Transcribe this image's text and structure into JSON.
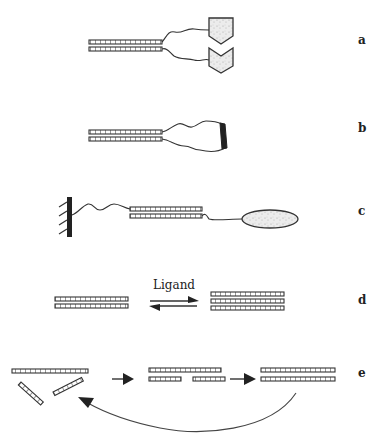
{
  "figure": {
    "type": "schematic",
    "panels": [
      {
        "id": "a",
        "label": "a",
        "description": "duplex with two flexible linkers ending in complementary pentagonal shapes"
      },
      {
        "id": "b",
        "label": "b",
        "description": "duplex with linkers joined into a closed loop capped by a dark bar"
      },
      {
        "id": "c",
        "label": "c",
        "description": "duplex tethered to a hatched surface on one strand and to an ellipse on the other"
      },
      {
        "id": "d",
        "label": "d",
        "description": "duplex in equilibrium with triplex upon ligand binding"
      },
      {
        "id": "e",
        "label": "e",
        "description": "strand plus two fragments assemble into nicked duplex, then ligated duplex, cycling back"
      }
    ],
    "ligand_label": "Ligand",
    "colors": {
      "ink": "#333333",
      "fill_light": "#e8e8e8",
      "fill_dark": "#222222",
      "background": "#ffffff"
    }
  }
}
